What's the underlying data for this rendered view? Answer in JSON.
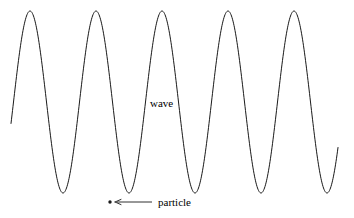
{
  "figure": {
    "background_color": "#ffffff",
    "stroke_color": "#1a1a1a",
    "width": 354,
    "height": 218
  },
  "labels": {
    "wave": "wave",
    "particle": "particle"
  },
  "annotations": {
    "particle_dot": "particle-dot",
    "particle_arrow": "leftward-arrow"
  },
  "chart_data": {
    "type": "line",
    "title": "",
    "xlabel": "",
    "ylabel": "",
    "grid": false,
    "legend": "none",
    "waveform": {
      "shape": "sine",
      "cycles": 5,
      "period_px": 66,
      "amplitude_px": 91,
      "crest_y_px": 11,
      "trough_y_px": 193,
      "midline_y_px": 102,
      "x_start_px": 11,
      "x_end_px": 338,
      "crest_x_px": [
        30,
        96,
        162,
        228,
        294
      ],
      "trough_x_px": [
        63,
        129,
        195,
        261,
        327
      ]
    },
    "markers": [
      {
        "name": "particle",
        "x_px": 110,
        "y_px": 202,
        "radius_px": 1.6
      }
    ],
    "arrows": [
      {
        "name": "particle-pointer",
        "x_start_px": 152,
        "x_end_px": 115,
        "y_px": 202,
        "direction": "left"
      }
    ]
  }
}
